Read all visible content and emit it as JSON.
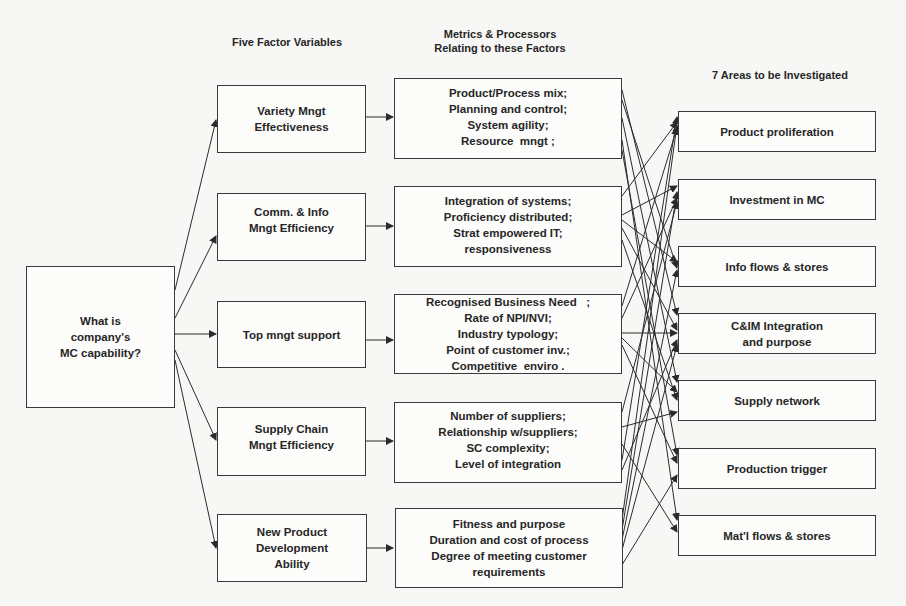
{
  "headers": {
    "factors": "Five Factor Variables",
    "metrics_line1": "Metrics & Processors",
    "metrics_line2": "Relating to these Factors",
    "areas": "7 Areas to be Investigated"
  },
  "root": {
    "lines": [
      "What is",
      "company's",
      "MC capability?"
    ]
  },
  "factors": [
    {
      "lines": [
        "Variety Mngt",
        "Effectiveness"
      ]
    },
    {
      "lines": [
        "Comm. & Info",
        "Mngt Efficiency"
      ]
    },
    {
      "lines": [
        "Top mngt support"
      ]
    },
    {
      "lines": [
        "Supply Chain",
        "Mngt Efficiency"
      ]
    },
    {
      "lines": [
        "New Product",
        "Development",
        "Ability"
      ]
    }
  ],
  "metrics": [
    {
      "lines": [
        "Product/Process mix;",
        "Planning and control;",
        "System agility;",
        "Resource  mngt ;"
      ]
    },
    {
      "lines": [
        "Integration of systems;",
        "Proficiency distributed;",
        "Strat empowered IT;",
        "responsiveness"
      ]
    },
    {
      "lines": [
        "Recognised Business Need   ;",
        "Rate of NPI/NVI;",
        "Industry typology;",
        "Point of customer inv.;",
        "Competitive  enviro ."
      ]
    },
    {
      "lines": [
        "Number of suppliers;",
        "Relationship w/suppliers;",
        "SC complexity;",
        "Level of integration"
      ]
    },
    {
      "lines": [
        "Fitness and purpose",
        "Duration and cost of process",
        "Degree of meeting customer",
        "requirements"
      ]
    }
  ],
  "areas": [
    {
      "lines": [
        "Product proliferation"
      ]
    },
    {
      "lines": [
        "Investment in MC"
      ]
    },
    {
      "lines": [
        "Info flows & stores"
      ]
    },
    {
      "lines": [
        "C&IM Integration",
        "and purpose"
      ]
    },
    {
      "lines": [
        "Supply network"
      ]
    },
    {
      "lines": [
        "Production trigger"
      ]
    },
    {
      "lines": [
        "Mat'l flows & stores"
      ]
    }
  ],
  "colors": {
    "line": "#2b2b2b",
    "box_border": "#3a3a3a",
    "background": "#f7f7f5"
  }
}
